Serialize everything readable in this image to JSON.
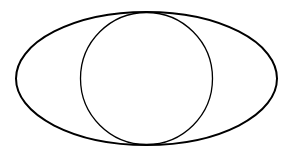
{
  "diagram": {
    "background": "#ffffff",
    "shapes": [
      {
        "type": "ellipse",
        "name": "outer-ellipse",
        "cx": 146.5,
        "cy": 78.5,
        "rx": 130.5,
        "ry": 66.5,
        "stroke": "#000000",
        "stroke_width": 2,
        "fill": "none"
      },
      {
        "type": "circle",
        "name": "inner-circle",
        "cx": 146.5,
        "cy": 78.5,
        "r": 66,
        "stroke": "#000000",
        "stroke_width": 1.3,
        "fill": "none"
      }
    ]
  }
}
